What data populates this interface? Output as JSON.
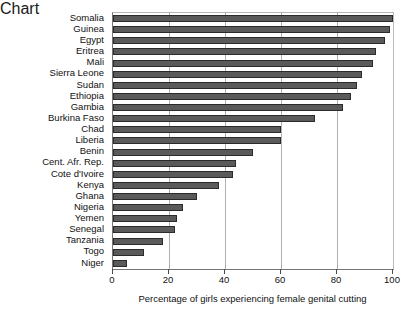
{
  "chart_data": {
    "type": "bar",
    "orientation": "horizontal",
    "title": "",
    "xlabel": "Percentage of girls experiencing female genital cutting",
    "ylabel": "",
    "xlim": [
      0,
      100
    ],
    "xticks": [
      0,
      20,
      40,
      60,
      80,
      100
    ],
    "xticklabels": [
      "0",
      "20",
      "40",
      "60",
      "80",
      "100"
    ],
    "grid": "vertical",
    "legend": "none",
    "categories": [
      "Somalia",
      "Guinea",
      "Egypt",
      "Eritrea",
      "Mali",
      "Sierra Leone",
      "Sudan",
      "Ethiopia",
      "Gambia",
      "Burkina Faso",
      "Chad",
      "Liberia",
      "Benin",
      "Cent. Afr. Rep.",
      "Cote d'Ivoire",
      "Kenya",
      "Ghana",
      "Nigeria",
      "Yemen",
      "Senegal",
      "Tanzania",
      "Togo",
      "Niger"
    ],
    "values": [
      100,
      99,
      97,
      94,
      93,
      89,
      87,
      85,
      82,
      72,
      60,
      60,
      50,
      44,
      43,
      38,
      30,
      25,
      23,
      22,
      18,
      11,
      5
    ],
    "bar_color": "#5a5a5a",
    "bar_edge_color": "#2b2b2b",
    "grid_color": "#b0b0b0",
    "axis_color": "#767676"
  }
}
